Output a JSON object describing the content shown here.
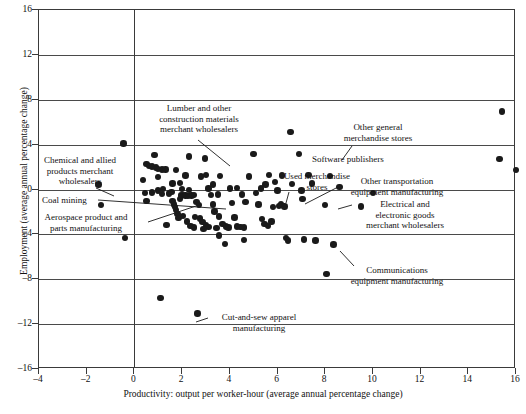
{
  "chart_data": {
    "type": "scatter",
    "title": "",
    "xlabel": "Productivity: output per worker-hour (average annual percentage change)",
    "ylabel": "Employment (average annual percentage change)",
    "xlim": [
      -4,
      16
    ],
    "ylim": [
      -16,
      16
    ],
    "xticks": [
      -4,
      -2,
      0,
      2,
      4,
      6,
      8,
      10,
      12,
      14,
      16
    ],
    "xticklabels": [
      "–4",
      "–2",
      "0",
      "2",
      "4",
      "6",
      "8",
      "10",
      "12",
      "14",
      "16"
    ],
    "yticks": [
      -16,
      -12,
      -8,
      -4,
      0,
      4,
      8,
      12,
      16
    ],
    "yticklabels": [
      "–16",
      "–12",
      "–8",
      "–4",
      "0",
      "4",
      "8",
      "12",
      "16"
    ],
    "gridlines_y": [
      -12,
      -8,
      -4,
      0,
      4,
      8,
      12
    ],
    "grid": "horizontal-only-plus-x-zero-vertical",
    "legend": "none",
    "marker_color": "#1a1a1a",
    "points": [
      [
        -0.45,
        4.1
      ],
      [
        -1.5,
        0.45
      ],
      [
        -1.4,
        -1.4
      ],
      [
        -0.4,
        -4.3
      ],
      [
        0.35,
        0.85
      ],
      [
        0.5,
        2.3
      ],
      [
        0.6,
        2.1
      ],
      [
        0.75,
        2.05
      ],
      [
        0.9,
        1.95
      ],
      [
        1.0,
        1.85
      ],
      [
        1.15,
        1.8
      ],
      [
        1.3,
        1.8
      ],
      [
        0.45,
        -0.3
      ],
      [
        0.5,
        -1.0
      ],
      [
        0.75,
        -0.25
      ],
      [
        0.85,
        3.05
      ],
      [
        1.0,
        1.1
      ],
      [
        1.15,
        -0.4
      ],
      [
        1.35,
        -3.15
      ],
      [
        1.45,
        -0.35
      ],
      [
        1.55,
        -0.2
      ],
      [
        1.6,
        -1.0
      ],
      [
        1.65,
        -1.35
      ],
      [
        1.7,
        -1.55
      ],
      [
        1.75,
        -1.85
      ],
      [
        1.8,
        -2.2
      ],
      [
        1.85,
        -2.55
      ],
      [
        1.9,
        -0.85
      ],
      [
        1.95,
        -0.55
      ],
      [
        2.05,
        -0.5
      ],
      [
        2.15,
        -0.55
      ],
      [
        2.25,
        -0.6
      ],
      [
        2.4,
        -0.55
      ],
      [
        2.5,
        -0.5
      ],
      [
        1.6,
        0.55
      ],
      [
        1.75,
        1.75
      ],
      [
        1.9,
        0.6
      ],
      [
        2.15,
        1.25
      ],
      [
        2.3,
        2.95
      ],
      [
        2.05,
        -2.35
      ],
      [
        2.2,
        -2.85
      ],
      [
        2.35,
        -3.25
      ],
      [
        2.5,
        -3.4
      ],
      [
        2.6,
        -1.1
      ],
      [
        2.7,
        -1.4
      ],
      [
        2.55,
        -2.45
      ],
      [
        2.75,
        -2.6
      ],
      [
        2.85,
        -2.9
      ],
      [
        3.0,
        -3.15
      ],
      [
        3.1,
        -3.35
      ],
      [
        2.8,
        1.15
      ],
      [
        2.95,
        2.75
      ],
      [
        3.1,
        0.1
      ],
      [
        3.2,
        -0.5
      ],
      [
        3.3,
        -1.35
      ],
      [
        3.35,
        -1.95
      ],
      [
        3.5,
        -0.45
      ],
      [
        3.55,
        -2.4
      ],
      [
        3.7,
        -3.05
      ],
      [
        3.85,
        -3.3
      ],
      [
        3.95,
        -3.4
      ],
      [
        3.3,
        0.45
      ],
      [
        3.6,
        1.2
      ],
      [
        3.55,
        -4.1
      ],
      [
        4.1,
        -1.2
      ],
      [
        4.2,
        -2.5
      ],
      [
        4.3,
        -3.3
      ],
      [
        4.45,
        -3.35
      ],
      [
        4.6,
        -3.4
      ],
      [
        4.3,
        0.15
      ],
      [
        4.5,
        -0.45
      ],
      [
        4.65,
        -1.1
      ],
      [
        4.8,
        1.15
      ],
      [
        5.0,
        3.15
      ],
      [
        5.1,
        -0.3
      ],
      [
        5.2,
        -1.35
      ],
      [
        5.35,
        -2.65
      ],
      [
        5.45,
        -3.1
      ],
      [
        5.6,
        -3.25
      ],
      [
        5.75,
        -2.85
      ],
      [
        5.5,
        0.45
      ],
      [
        5.65,
        1.3
      ],
      [
        5.9,
        0.65
      ],
      [
        6.0,
        -0.1
      ],
      [
        6.15,
        -1.3
      ],
      [
        6.3,
        -1.5
      ],
      [
        6.35,
        -4.3
      ],
      [
        6.45,
        -4.55
      ],
      [
        6.2,
        1.25
      ],
      [
        6.55,
        5.15
      ],
      [
        6.9,
        3.15
      ],
      [
        7.0,
        -0.1
      ],
      [
        7.05,
        -0.85
      ],
      [
        7.1,
        -4.45
      ],
      [
        7.3,
        1.3
      ],
      [
        7.45,
        0.55
      ],
      [
        7.6,
        -4.55
      ],
      [
        8.0,
        -1.4
      ],
      [
        8.2,
        1.2
      ],
      [
        8.35,
        -4.9
      ],
      [
        8.6,
        0.25
      ],
      [
        9.5,
        -1.5
      ],
      [
        3.8,
        -4.85
      ],
      [
        4.6,
        -4.5
      ],
      [
        2.65,
        -11.05
      ],
      [
        1.1,
        -9.65
      ],
      [
        8.05,
        -7.55
      ],
      [
        10.0,
        -0.3
      ],
      [
        15.4,
        6.95
      ],
      [
        15.3,
        2.7
      ],
      [
        16.0,
        1.75
      ],
      [
        1.0,
        -0.1
      ],
      [
        1.2,
        0.05
      ],
      [
        2.0,
        0.05
      ],
      [
        2.3,
        -0.05
      ],
      [
        3.0,
        1.3
      ],
      [
        4.0,
        0.1
      ],
      [
        5.3,
        0.1
      ],
      [
        6.6,
        0.5
      ],
      [
        2.9,
        -3.5
      ],
      [
        3.45,
        -3.45
      ],
      [
        5.8,
        -1.55
      ],
      [
        6.05,
        -1.45
      ]
    ],
    "annotations": [
      {
        "key": "lumber",
        "text": "Lumber and other\nconstruction materials\nmerchant wholesalers",
        "align": "center",
        "left": 140,
        "top": 103,
        "width": 118,
        "leader": [
          198,
          140,
          230,
          166
        ]
      },
      {
        "key": "chemical",
        "text": "Chemical and allied\nproducts merchant\nwholesalers",
        "align": "center",
        "left": 30,
        "top": 155,
        "width": 100,
        "leader": [
          96,
          188,
          114,
          196
        ]
      },
      {
        "key": "coal",
        "text": "Coal mining",
        "align": "left",
        "left": 42,
        "top": 195,
        "width": 70,
        "leader": [
          98,
          200,
          226,
          209
        ]
      },
      {
        "key": "aerospace",
        "text": "Aerospace product and\nparts manufacturing",
        "align": "center",
        "left": 26,
        "top": 212,
        "width": 120,
        "leader": [
          148,
          222,
          196,
          206
        ]
      },
      {
        "key": "other-general",
        "text": "Other general\nmerchandise stores",
        "align": "center",
        "left": 328,
        "top": 122,
        "width": 100,
        "leader": [
          352,
          146,
          342,
          160
        ]
      },
      {
        "key": "software",
        "text": "Software publishers",
        "align": "left",
        "left": 312,
        "top": 154,
        "width": 96,
        "leader": null
      },
      {
        "key": "used-merch",
        "text": "Used merchandise\nstores",
        "align": "center",
        "left": 270,
        "top": 171,
        "width": 94,
        "leader": [
          289,
          192,
          286,
          203
        ]
      },
      {
        "key": "other-transport",
        "text": "Other transportation\nequipment manufacturing",
        "align": "center",
        "left": 336,
        "top": 176,
        "width": 122,
        "leader": [
          340,
          186,
          305,
          204
        ]
      },
      {
        "key": "electrical",
        "text": "Electrical and\nelectronic goods\nmerchant wholesalers",
        "align": "center",
        "left": 350,
        "top": 199,
        "width": 110,
        "leader": [
          352,
          205,
          338,
          209
        ]
      },
      {
        "key": "communications",
        "text": "Communications\nequipment manufacturing",
        "align": "center",
        "left": 336,
        "top": 265,
        "width": 122,
        "leader": [
          354,
          266,
          340,
          251
        ]
      },
      {
        "key": "cutandsew",
        "text": "Cut-and-sew apparel\nmanufacturing",
        "align": "center",
        "left": 204,
        "top": 312,
        "width": 110,
        "leader": [
          208,
          318,
          196,
          322
        ]
      }
    ]
  }
}
